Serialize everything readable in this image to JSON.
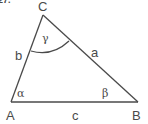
{
  "header_fragment": "27.",
  "triangle": {
    "vertices": {
      "A": {
        "label": "A",
        "x": 11,
        "y": 102
      },
      "B": {
        "label": "B",
        "x": 138,
        "y": 102
      },
      "C": {
        "label": "C",
        "x": 43,
        "y": 15
      }
    },
    "sides": {
      "a": {
        "label": "a"
      },
      "b": {
        "label": "b"
      },
      "c": {
        "label": "c"
      }
    },
    "angles": {
      "alpha": {
        "label": "α"
      },
      "beta": {
        "label": "β"
      },
      "gamma": {
        "label": "γ"
      }
    }
  }
}
